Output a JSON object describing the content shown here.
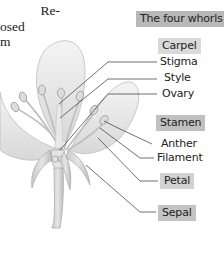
{
  "body_text": {
    "lines": [
      "Re-",
      "osed",
      "m"
    ]
  },
  "diagram": {
    "title": "The four whorls",
    "groups": [
      {
        "name": "Carpel",
        "parts": [
          "Stigma",
          "Style",
          "Ovary"
        ]
      },
      {
        "name": "Stamen",
        "parts": [
          "Anther",
          "Filament"
        ]
      },
      {
        "name": "Petal",
        "parts": []
      },
      {
        "name": "Sepal",
        "parts": []
      }
    ]
  },
  "colors": {
    "title_box": "#b8b8b8",
    "group_box_light": "#dadada",
    "group_box_dark": "#c0c0c0",
    "leader_line": "#333333",
    "petal_fill": "#ececec",
    "petal_stroke": "#bdbdbd"
  }
}
